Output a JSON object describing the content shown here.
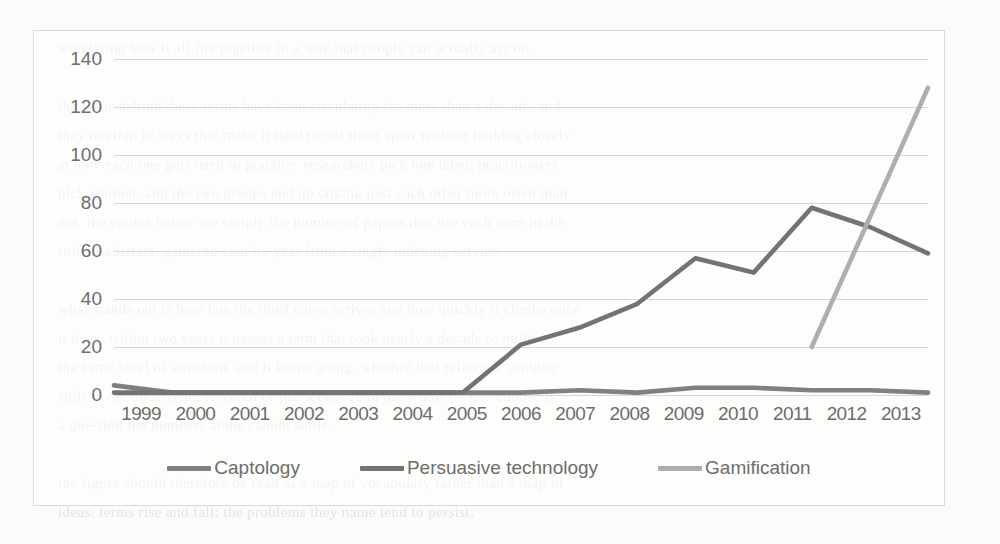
{
  "figure": {
    "border_color": "#d9d9d6",
    "background": "#ffffff"
  },
  "chart_data": {
    "type": "line",
    "title": "",
    "xlabel": "",
    "ylabel": "",
    "ylim": [
      0,
      140
    ],
    "yticks": [
      0,
      20,
      40,
      60,
      80,
      100,
      120,
      140
    ],
    "grid": true,
    "legend_position": "bottom",
    "categories": [
      "1999",
      "2000",
      "2001",
      "2002",
      "2003",
      "2004",
      "2005",
      "2006",
      "2007",
      "2008",
      "2009",
      "2010",
      "2011",
      "2012",
      "2013"
    ],
    "series": [
      {
        "name": "Captology",
        "color": "#808080",
        "values": [
          4,
          1,
          1,
          1,
          1,
          1,
          1,
          1,
          2,
          1,
          3,
          3,
          2,
          2,
          1
        ]
      },
      {
        "name": "Persuasive technology",
        "color": "#737373",
        "values": [
          1,
          1,
          1,
          1,
          1,
          1,
          1,
          21,
          28,
          38,
          57,
          51,
          78,
          70,
          59
        ]
      },
      {
        "name": "Gamification",
        "color": "#aeaeae",
        "values": [
          null,
          null,
          null,
          null,
          null,
          null,
          null,
          null,
          null,
          null,
          null,
          null,
          20,
          74,
          128
        ]
      }
    ]
  },
  "yaxis": {
    "ticks": [
      "140",
      "120",
      "100",
      "80",
      "60",
      "40",
      "20",
      "0"
    ]
  },
  "xaxis": {
    "ticks": [
      "1999",
      "2000",
      "2001",
      "2002",
      "2003",
      "2004",
      "2005",
      "2006",
      "2007",
      "2008",
      "2009",
      "2010",
      "2011",
      "2012",
      "2013"
    ]
  },
  "legend": {
    "items": [
      {
        "label": "Captology",
        "color": "#808080"
      },
      {
        "label": "Persuasive technology",
        "color": "#737373"
      },
      {
        "label": "Gamification",
        "color": "#aeaeae"
      }
    ]
  },
  "page_bleed_text": "wondering how it all fits together in a way that people can actually act on.\n\nthe ideas behind these terms have been circulating for more than a decade, and\nthey overlap in ways that make it hard to tell them apart without looking closely\nat how each one gets used in practice. researchers pick one label, practitioners\npick another, and the two groups end up talking past each other more often than\nnot. the counts below are simply the number of papers that use each term in the\ntitle or abstract, gathered year by year from a single indexing service.\n\nwhat stands out is how late the third curve arrives and how quickly it climbs once\nit does. within two years it passes a term that took nearly a decade to build up\nthe same level of attention, and it keeps going. whether that reflects a genuine\nshift in the underlying research or just a change in the words people choose is\na question the numbers alone cannot settle.\n\nthe figure should therefore be read as a map of vocabulary rather than a map of\nideas. terms rise and fall; the problems they name tend to persist."
}
